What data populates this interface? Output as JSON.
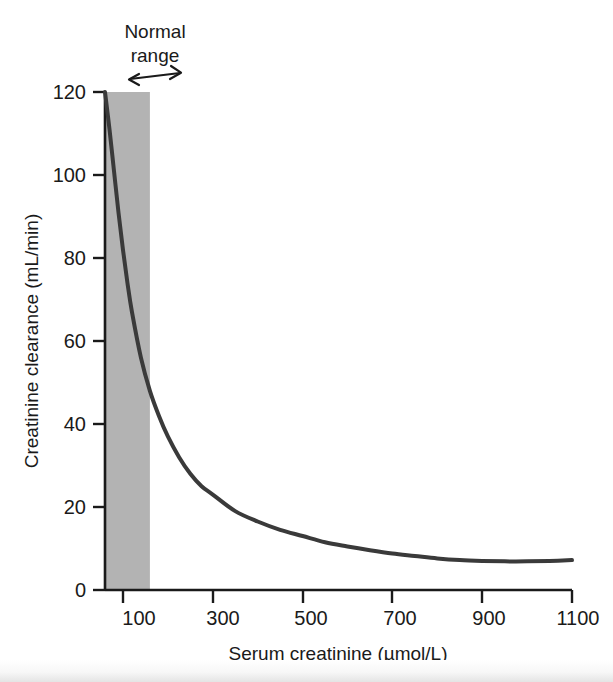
{
  "chart_data": {
    "type": "line",
    "title": "",
    "xlabel": "Serum creatinine (µmol/L)",
    "ylabel": "Creatinine clearance (mL/min)",
    "xlim": [
      60,
      1100
    ],
    "ylim": [
      0,
      120
    ],
    "xticks": [
      100,
      300,
      500,
      700,
      900,
      1100
    ],
    "xticklabels": [
      "100",
      "300",
      "500",
      "700",
      "900",
      "1100"
    ],
    "yticks": [
      0,
      20,
      40,
      60,
      80,
      100,
      120
    ],
    "yticklabels": [
      "0",
      "20",
      "40",
      "60",
      "80",
      "100",
      "120"
    ],
    "grid": false,
    "legend": "none",
    "line_color": "#3a3a3a",
    "line_width": 4,
    "series": [
      {
        "name": "Creatinine clearance",
        "x": [
          60,
          70,
          80,
          90,
          100,
          110,
          120,
          140,
          160,
          180,
          200,
          225,
          250,
          275,
          300,
          350,
          400,
          450,
          500,
          550,
          600,
          650,
          700,
          750,
          800,
          850,
          900,
          950,
          1000,
          1050,
          1100
        ],
        "y": [
          120,
          111,
          101,
          91,
          82,
          74,
          67,
          56,
          48,
          42,
          37,
          32,
          28,
          25,
          23,
          19,
          16.5,
          14.5,
          13,
          11.5,
          10.5,
          9.6,
          8.8,
          8.2,
          7.6,
          7.2,
          7.0,
          6.9,
          6.9,
          7.0,
          7.2
        ]
      }
    ],
    "shaded_regions": [
      {
        "name": "normal-range-band",
        "x_start": 60,
        "x_end": 160,
        "y_start": 0,
        "y_end": 120,
        "color": "#b3b3b3"
      }
    ],
    "annotations": [
      {
        "name": "normal-range-annotation",
        "text_line1": "Normal",
        "text_line2": "range",
        "arrow": "double-headed",
        "x_start": 60,
        "x_end": 160
      }
    ]
  }
}
